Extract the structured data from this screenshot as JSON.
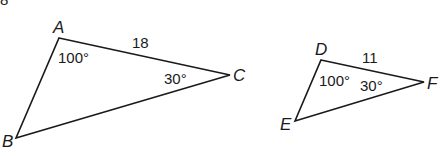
{
  "figure": {
    "corner_fragment": "8",
    "triangles": [
      {
        "name": "ABC",
        "vertices": {
          "A": {
            "label": "A",
            "x": 59,
            "y": 38
          },
          "B": {
            "label": "B",
            "x": 16,
            "y": 138
          },
          "C": {
            "label": "C",
            "x": 230,
            "y": 75
          }
        },
        "side_label": "18",
        "angle_A": "100°",
        "angle_C": "30°"
      },
      {
        "name": "DEF",
        "vertices": {
          "D": {
            "label": "D",
            "x": 321,
            "y": 60
          },
          "E": {
            "label": "E",
            "x": 295,
            "y": 121
          },
          "F": {
            "label": "F",
            "x": 424,
            "y": 82
          }
        },
        "side_label": "11",
        "angle_D": "100°",
        "angle_F": "30°"
      }
    ]
  }
}
